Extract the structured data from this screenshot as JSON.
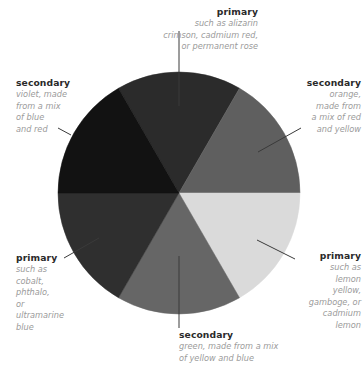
{
  "diagram": {
    "type": "color-wheel",
    "center": {
      "x": 179,
      "y": 193
    },
    "radius": 121,
    "segments": [
      {
        "id": "top",
        "start_deg": 60,
        "end_deg": 120,
        "fill": "#2b2b2b",
        "role": "primary"
      },
      {
        "id": "upper-right",
        "start_deg": 0,
        "end_deg": 60,
        "fill": "#5f5f5f",
        "role": "secondary"
      },
      {
        "id": "lower-right",
        "start_deg": 300,
        "end_deg": 360,
        "fill": "#dadada",
        "role": "primary"
      },
      {
        "id": "bottom",
        "start_deg": 240,
        "end_deg": 300,
        "fill": "#666666",
        "role": "secondary"
      },
      {
        "id": "lower-left",
        "start_deg": 180,
        "end_deg": 240,
        "fill": "#2f2f2f",
        "role": "primary"
      },
      {
        "id": "upper-left",
        "start_deg": 120,
        "end_deg": 180,
        "fill": "#121212",
        "role": "secondary"
      }
    ],
    "leader_color": "#3a3a3a"
  },
  "labels": {
    "top": {
      "title": "primary",
      "desc": "such as alizarin\ncrimson, cadmium red,\nor permanent rose"
    },
    "upper_right": {
      "title": "secondary",
      "desc": "orange,\nmade from\na mix of red\nand yellow"
    },
    "lower_right": {
      "title": "primary",
      "desc": "such as\nlemon\nyellow,\ngamboge, or\ncadmium\nlemon"
    },
    "bottom": {
      "title": "secondary",
      "desc": "green, made from a mix\nof yellow and blue"
    },
    "lower_left": {
      "title": "primary",
      "desc": "such as\ncobalt,\nphthalo,\nor\nultramarine\nblue"
    },
    "upper_left": {
      "title": "secondary",
      "desc": "violet, made\nfrom a mix\nof blue\nand red"
    }
  }
}
